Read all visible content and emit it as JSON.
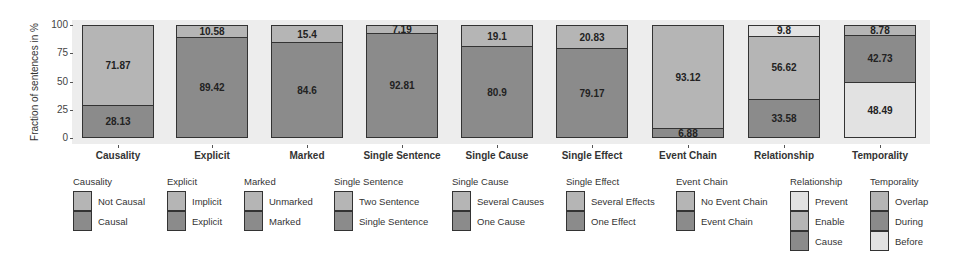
{
  "colors": {
    "light": "#b5b5b5",
    "dark": "#8b8b8b",
    "lightest": "#e2e2e2",
    "plot_bg": "#ededed"
  },
  "chart_data": {
    "type": "bar",
    "stacked": true,
    "title": "",
    "xlabel": "",
    "ylabel": "Fraction of sentences in %",
    "ylim": [
      0,
      100
    ],
    "yticks": [
      0,
      25,
      50,
      75,
      100
    ],
    "grid": false,
    "legend_position": "bottom",
    "categories": [
      "Causality",
      "Explicit",
      "Marked",
      "Single Sentence",
      "Single Cause",
      "Single Effect",
      "Event Chain",
      "Relationship",
      "Temporality"
    ],
    "bars": [
      {
        "category": "Causality",
        "segments_top_to_bottom": [
          {
            "name": "Not Causal",
            "value": 71.87,
            "color": "light"
          },
          {
            "name": "Causal",
            "value": 28.13,
            "color": "dark"
          }
        ]
      },
      {
        "category": "Explicit",
        "segments_top_to_bottom": [
          {
            "name": "Implicit",
            "value": 10.58,
            "color": "light"
          },
          {
            "name": "Explicit",
            "value": 89.42,
            "color": "dark"
          }
        ]
      },
      {
        "category": "Marked",
        "segments_top_to_bottom": [
          {
            "name": "Unmarked",
            "value": 15.4,
            "color": "light"
          },
          {
            "name": "Marked",
            "value": 84.6,
            "color": "dark"
          }
        ]
      },
      {
        "category": "Single Sentence",
        "segments_top_to_bottom": [
          {
            "name": "Two Sentence",
            "value": 7.19,
            "color": "light"
          },
          {
            "name": "Single Sentence",
            "value": 92.81,
            "color": "dark"
          }
        ]
      },
      {
        "category": "Single Cause",
        "segments_top_to_bottom": [
          {
            "name": "Several Causes",
            "value": 19.1,
            "color": "light"
          },
          {
            "name": "One Cause",
            "value": 80.9,
            "color": "dark"
          }
        ]
      },
      {
        "category": "Single Effect",
        "segments_top_to_bottom": [
          {
            "name": "Several Effects",
            "value": 20.83,
            "color": "light"
          },
          {
            "name": "One Effect",
            "value": 79.17,
            "color": "dark"
          }
        ]
      },
      {
        "category": "Event Chain",
        "segments_top_to_bottom": [
          {
            "name": "No Event Chain",
            "value": 93.12,
            "color": "light"
          },
          {
            "name": "Event Chain",
            "value": 6.88,
            "color": "dark"
          }
        ]
      },
      {
        "category": "Relationship",
        "segments_top_to_bottom": [
          {
            "name": "Prevent",
            "value": 9.8,
            "color": "lightest"
          },
          {
            "name": "Enable",
            "value": 56.62,
            "color": "light"
          },
          {
            "name": "Cause",
            "value": 33.58,
            "color": "dark"
          }
        ]
      },
      {
        "category": "Temporality",
        "segments_top_to_bottom": [
          {
            "name": "Overlap",
            "value": 8.78,
            "color": "light"
          },
          {
            "name": "During",
            "value": 42.73,
            "color": "dark"
          },
          {
            "name": "Before",
            "value": 48.49,
            "color": "lightest"
          }
        ]
      }
    ],
    "legends": [
      {
        "title": "Causality",
        "items": [
          {
            "label": "Not Causal",
            "color": "light"
          },
          {
            "label": "Causal",
            "color": "dark"
          }
        ]
      },
      {
        "title": "Explicit",
        "items": [
          {
            "label": "Implicit",
            "color": "light"
          },
          {
            "label": "Explicit",
            "color": "dark"
          }
        ]
      },
      {
        "title": "Marked",
        "items": [
          {
            "label": "Unmarked",
            "color": "light"
          },
          {
            "label": "Marked",
            "color": "dark"
          }
        ]
      },
      {
        "title": "Single Sentence",
        "items": [
          {
            "label": "Two Sentence",
            "color": "light"
          },
          {
            "label": "Single Sentence",
            "color": "dark"
          }
        ]
      },
      {
        "title": "Single Cause",
        "items": [
          {
            "label": "Several Causes",
            "color": "light"
          },
          {
            "label": "One Cause",
            "color": "dark"
          }
        ]
      },
      {
        "title": "Single Effect",
        "items": [
          {
            "label": "Several Effects",
            "color": "light"
          },
          {
            "label": "One Effect",
            "color": "dark"
          }
        ]
      },
      {
        "title": "Event Chain",
        "items": [
          {
            "label": "No Event Chain",
            "color": "light"
          },
          {
            "label": "Event Chain",
            "color": "dark"
          }
        ]
      },
      {
        "title": "Relationship",
        "items": [
          {
            "label": "Prevent",
            "color": "lightest"
          },
          {
            "label": "Enable",
            "color": "light"
          },
          {
            "label": "Cause",
            "color": "dark"
          }
        ]
      },
      {
        "title": "Temporality",
        "items": [
          {
            "label": "Overlap",
            "color": "light"
          },
          {
            "label": "During",
            "color": "dark"
          },
          {
            "label": "Before",
            "color": "lightest"
          }
        ]
      }
    ]
  },
  "layout": {
    "bar_lefts": [
      82,
      176,
      271,
      366,
      461,
      556,
      652,
      748,
      844
    ],
    "legend_lefts": [
      73,
      167,
      244,
      334,
      452,
      566,
      676,
      790,
      870
    ],
    "plot_top": 25,
    "plot_bottom": 138
  }
}
